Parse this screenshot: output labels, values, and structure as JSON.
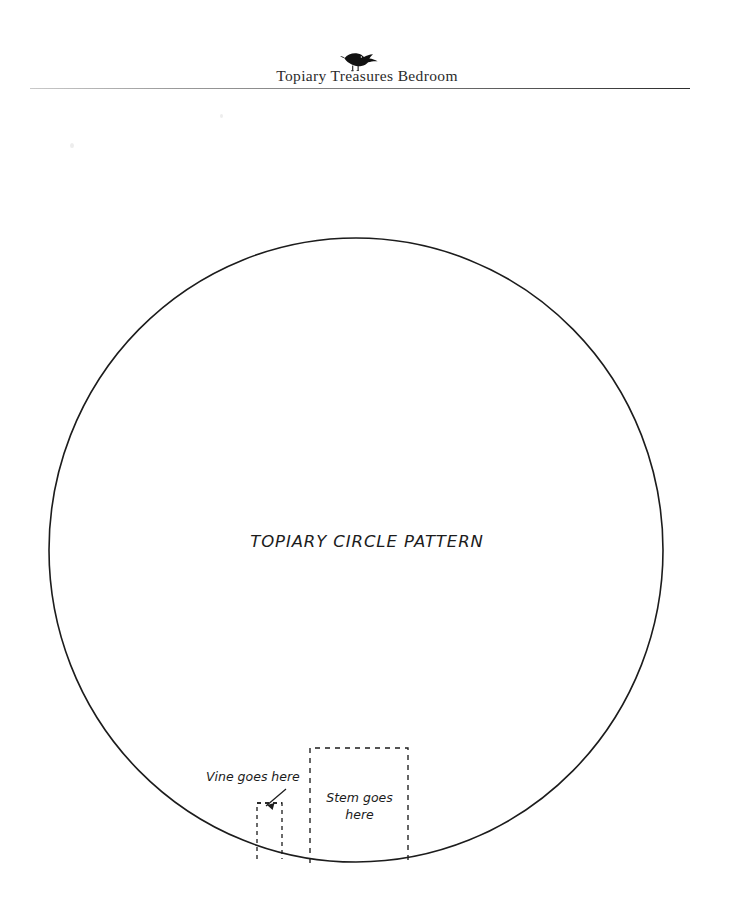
{
  "page": {
    "width": 734,
    "height": 913,
    "background_color": "#ffffff",
    "ink_color": "#1c1c1c"
  },
  "header": {
    "bird_icon_name": "bird-silhouette-icon",
    "title": "Topiary Treasures Bedroom",
    "rule_color": "#6e6e6e"
  },
  "pattern": {
    "center_label": "TOPIARY CIRCLE PATTERN",
    "circle": {
      "center_x": 356,
      "center_y": 550,
      "radius_x": 307,
      "radius_y": 312,
      "stroke_color": "#1c1c1c",
      "stroke_width": 1.6,
      "fill": "none"
    },
    "vine": {
      "label": "Vine goes here",
      "box_x": 257,
      "box_y": 803,
      "box_width": 25,
      "box_height": 56,
      "dash_style": "4 4",
      "arrow_from_x": 286,
      "arrow_from_y": 789,
      "arrow_to_x": 266,
      "arrow_to_y": 806
    },
    "stem": {
      "label_line1": "Stem goes",
      "label_line2": "here",
      "box_x": 310,
      "box_y": 748,
      "box_width": 98,
      "box_height": 115,
      "dash_style": "5 5"
    }
  },
  "chart_data": {
    "type": "diagram",
    "title": "TOPIARY CIRCLE PATTERN",
    "shapes": [
      {
        "name": "topiary-circle",
        "kind": "ellipse",
        "cx": 356,
        "cy": 550,
        "rx": 307,
        "ry": 312,
        "stroke": "solid",
        "label": "TOPIARY CIRCLE PATTERN"
      },
      {
        "name": "vine-placement-box",
        "kind": "rect",
        "x": 257,
        "y": 803,
        "width": 25,
        "height": 56,
        "stroke": "dashed",
        "label": "Vine goes here"
      },
      {
        "name": "stem-placement-box",
        "kind": "rect",
        "x": 310,
        "y": 748,
        "width": 98,
        "height": 115,
        "stroke": "dashed",
        "label": "Stem goes here"
      },
      {
        "name": "vine-pointer-arrow",
        "kind": "arrow",
        "x1": 286,
        "y1": 789,
        "x2": 266,
        "y2": 806,
        "stroke": "solid"
      }
    ]
  }
}
